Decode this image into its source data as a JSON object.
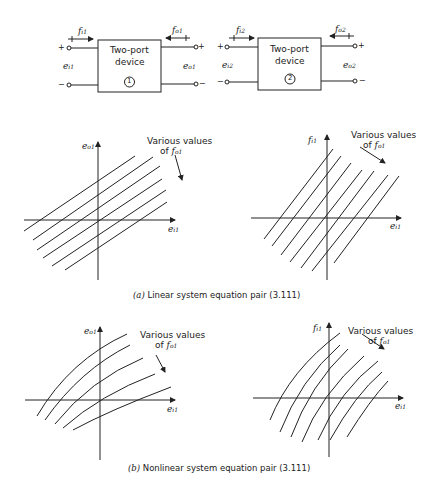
{
  "devices": [
    {
      "title_line1": "Two-port",
      "title_line2": "device",
      "number": "1",
      "input_flow": "f",
      "input_flow_sub": "i1",
      "output_flow": "f",
      "output_flow_sub": "o1",
      "input_effort": "e",
      "input_effort_sub": "i1",
      "output_effort": "e",
      "output_effort_sub": "o1",
      "plus": "+",
      "minus": "−"
    },
    {
      "title_line1": "Two-port",
      "title_line2": "device",
      "number": "2",
      "input_flow": "f",
      "input_flow_sub": "i2",
      "output_flow": "f",
      "output_flow_sub": "o2",
      "input_effort": "e",
      "input_effort_sub": "i2",
      "output_effort": "e",
      "output_effort_sub": "o2",
      "plus": "+",
      "minus": "−"
    }
  ],
  "annotation": {
    "line1": "Various values",
    "line2": "of ",
    "var": "f",
    "var_sub": "o1"
  },
  "plots": {
    "a_left": {
      "ylabel": "e",
      "ylabel_sub": "o1",
      "xlabel": "e",
      "xlabel_sub": "i1"
    },
    "a_right": {
      "ylabel": "f",
      "ylabel_sub": "i1",
      "xlabel": "e",
      "xlabel_sub": "i1"
    },
    "b_left": {
      "ylabel": "e",
      "ylabel_sub": "o1",
      "xlabel": "e",
      "xlabel_sub": "i1"
    },
    "b_right": {
      "ylabel": "f",
      "ylabel_sub": "i1",
      "xlabel": "e",
      "xlabel_sub": "i1"
    }
  },
  "captions": {
    "a_label": "(a)",
    "a_text": "Linear system equation pair (3.111)",
    "b_label": "(b)",
    "b_text": "Nonlinear system equation pair (3.111)"
  }
}
